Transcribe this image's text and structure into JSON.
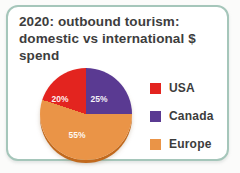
{
  "card": {
    "title": "2020: outbound tourism: domestic vs international $ spend"
  },
  "chart_data": {
    "type": "pie",
    "title": "2020: outbound tourism: domestic vs international $ spend",
    "legend_position": "right",
    "slices": [
      {
        "name": "Canada",
        "value": 25,
        "display": "25%",
        "color": "#5a3a92"
      },
      {
        "name": "Europe",
        "value": 55,
        "display": "55%",
        "color": "#ea9447"
      },
      {
        "name": "USA",
        "value": 20,
        "display": "20%",
        "color": "#e3241f"
      }
    ],
    "legend": {
      "items": [
        {
          "label": "USA",
          "color": "#e3241f"
        },
        {
          "label": "Canada",
          "color": "#5a3a92"
        },
        {
          "label": "Europe",
          "color": "#ea9447"
        }
      ]
    }
  },
  "theme": {
    "card_border": "#a5c6ba",
    "title_text": "#3d3d3d",
    "slice_label_text": "#ffffff",
    "pie_bottom_rim": "#c1691d",
    "page_background": "#fbfbfa"
  }
}
